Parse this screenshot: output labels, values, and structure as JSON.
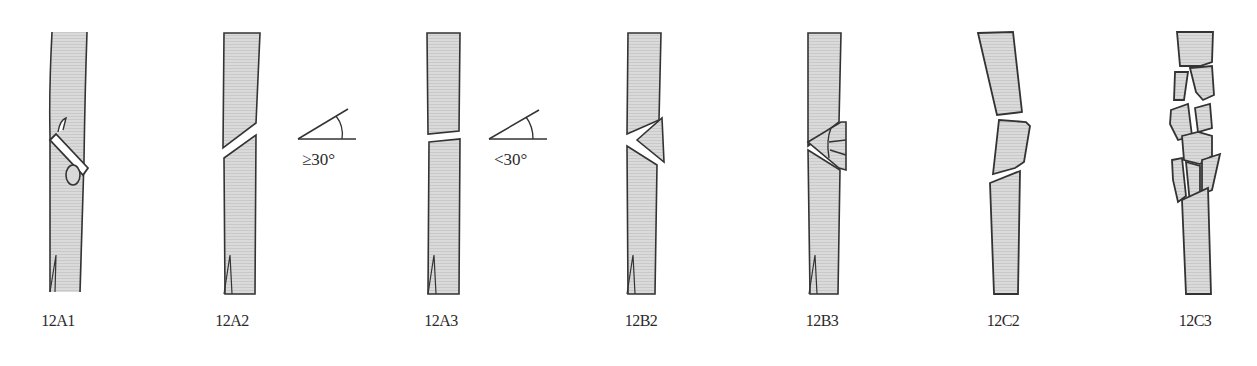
{
  "figure": {
    "bone_fill": "#d9d9d9",
    "outline_color": "#333333",
    "panels": [
      {
        "id": "12A1",
        "label": "12A1",
        "type": "spiral fracture"
      },
      {
        "id": "12A2",
        "label": "12A2",
        "type": "oblique fracture",
        "angle_note": "≥30°"
      },
      {
        "id": "12A3",
        "label": "12A3",
        "type": "transverse fracture",
        "angle_note": "<30°"
      },
      {
        "id": "12B2",
        "label": "12B2",
        "type": "wedge fracture, intact wedge"
      },
      {
        "id": "12B3",
        "label": "12B3",
        "type": "wedge fracture, fragmented wedge"
      },
      {
        "id": "12C2",
        "label": "12C2",
        "type": "segmental fracture"
      },
      {
        "id": "12C3",
        "label": "12C3",
        "type": "comminuted / irregular fracture"
      }
    ],
    "angle_labels": {
      "a2": "≥30°",
      "a3": "<30°"
    }
  }
}
